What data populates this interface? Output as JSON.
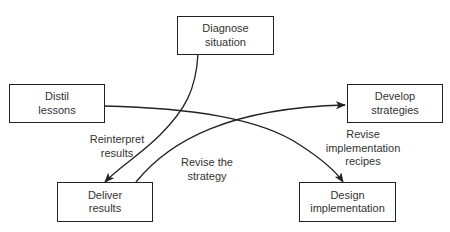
{
  "nodes": {
    "diagnose": "Diagnose\nsituation",
    "distil": "Distil\nlessons",
    "develop": "Develop\nstrategies",
    "deliver": "Deliver\nresults",
    "design": "Design\nimplementation"
  },
  "edges": {
    "reinterpret": "Reinterpret\nresults",
    "revise_strategy": "Revise the\nstrategy",
    "revise_implementation": "Revise\nimplementation\nrecipes"
  },
  "colors": {
    "stroke": "#222222",
    "text": "#333333"
  }
}
